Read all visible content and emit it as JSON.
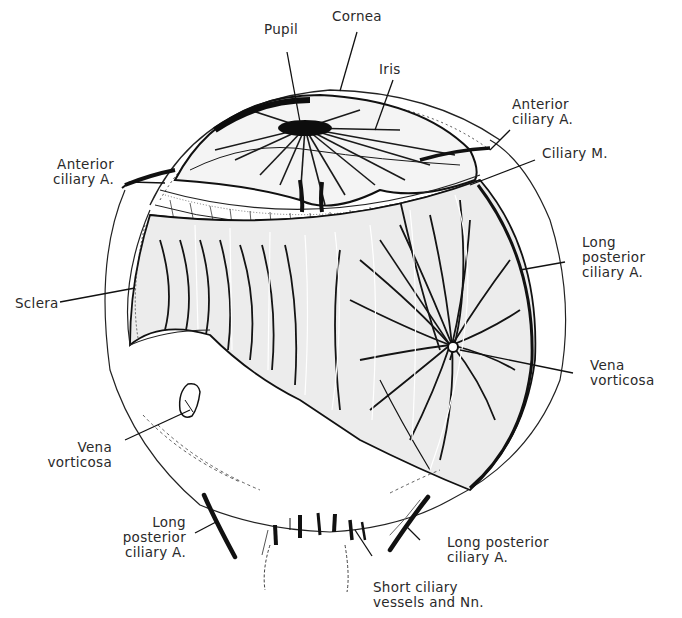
{
  "diagram": {
    "labels": {
      "pupil": {
        "text": "Pupil"
      },
      "cornea": {
        "text": "Cornea"
      },
      "iris": {
        "text": "Iris"
      },
      "anterior_ciliary_right": {
        "line1": "Anterior",
        "line2": "ciliary A."
      },
      "ciliary_muscle": {
        "text": "Ciliary M."
      },
      "anterior_ciliary_left": {
        "line1": "Anterior",
        "line2": "ciliary A."
      },
      "sclera": {
        "text": "Sclera"
      },
      "long_posterior_ciliary_right_upper": {
        "line1": "Long",
        "line2": "posterior",
        "line3": "ciliary A."
      },
      "vena_vorticosa_right": {
        "line1": "Vena",
        "line2": "vorticosa"
      },
      "vena_vorticosa_left": {
        "line1": "Vena",
        "line2": "vorticosa"
      },
      "long_posterior_ciliary_lower_left": {
        "line1": "Long",
        "line2": "posterior",
        "line3": "ciliary A."
      },
      "long_posterior_ciliary_lower_right": {
        "line1": "Long posterior",
        "line2": "ciliary A."
      },
      "short_ciliary": {
        "line1": "Short ciliary",
        "line2": "vessels and Nn."
      }
    },
    "colors": {
      "ink": "#1a1a1a",
      "paper": "#ffffff",
      "shade": "#d9d9d9"
    }
  }
}
